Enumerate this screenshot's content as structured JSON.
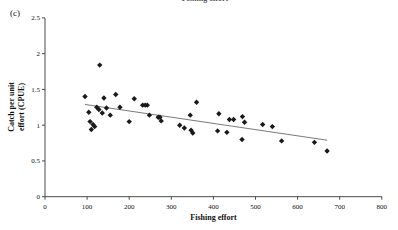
{
  "page": {
    "top_clipped_label": "Fishing effort",
    "panel_label": "(c)"
  },
  "chart_data": {
    "type": "scatter",
    "title": "",
    "xlabel": "Fishing effort",
    "ylabel_lines": [
      "Catch per unit",
      "effort (CPUE)"
    ],
    "xlim": [
      0,
      800
    ],
    "ylim": [
      0,
      2.5
    ],
    "x_ticks": [
      0,
      100,
      200,
      300,
      400,
      500,
      600,
      700,
      800
    ],
    "y_ticks": [
      0,
      0.5,
      1,
      1.5,
      2,
      2.5
    ],
    "grid": false,
    "legend": "none",
    "marker": "diamond",
    "marker_color": "#1a1a1a",
    "axis_color": "#4a4a4a",
    "trendline": {
      "x1": 95,
      "y1": 1.29,
      "x2": 670,
      "y2": 0.79,
      "color": "#7a7a7a"
    },
    "points": [
      [
        130,
        1.84
      ],
      [
        95,
        1.4
      ],
      [
        140,
        1.38
      ],
      [
        168,
        1.43
      ],
      [
        212,
        1.37
      ],
      [
        104,
        1.18
      ],
      [
        123,
        1.25
      ],
      [
        128,
        1.22
      ],
      [
        136,
        1.17
      ],
      [
        146,
        1.24
      ],
      [
        155,
        1.14
      ],
      [
        107,
        1.05
      ],
      [
        114,
        1.01
      ],
      [
        118,
        0.98
      ],
      [
        110,
        0.94
      ],
      [
        178,
        1.25
      ],
      [
        200,
        1.05
      ],
      [
        232,
        1.28
      ],
      [
        238,
        1.28
      ],
      [
        243,
        1.28
      ],
      [
        248,
        1.14
      ],
      [
        269,
        1.11
      ],
      [
        273,
        1.11
      ],
      [
        276,
        1.06
      ],
      [
        320,
        1.0
      ],
      [
        331,
        0.96
      ],
      [
        345,
        1.14
      ],
      [
        347,
        0.93
      ],
      [
        351,
        0.89
      ],
      [
        360,
        1.32
      ],
      [
        413,
        1.16
      ],
      [
        410,
        0.92
      ],
      [
        432,
        0.9
      ],
      [
        438,
        1.08
      ],
      [
        448,
        1.08
      ],
      [
        469,
        1.12
      ],
      [
        474,
        1.04
      ],
      [
        468,
        0.8
      ],
      [
        517,
        1.01
      ],
      [
        540,
        0.98
      ],
      [
        562,
        0.78
      ],
      [
        640,
        0.76
      ],
      [
        670,
        0.64
      ]
    ]
  }
}
